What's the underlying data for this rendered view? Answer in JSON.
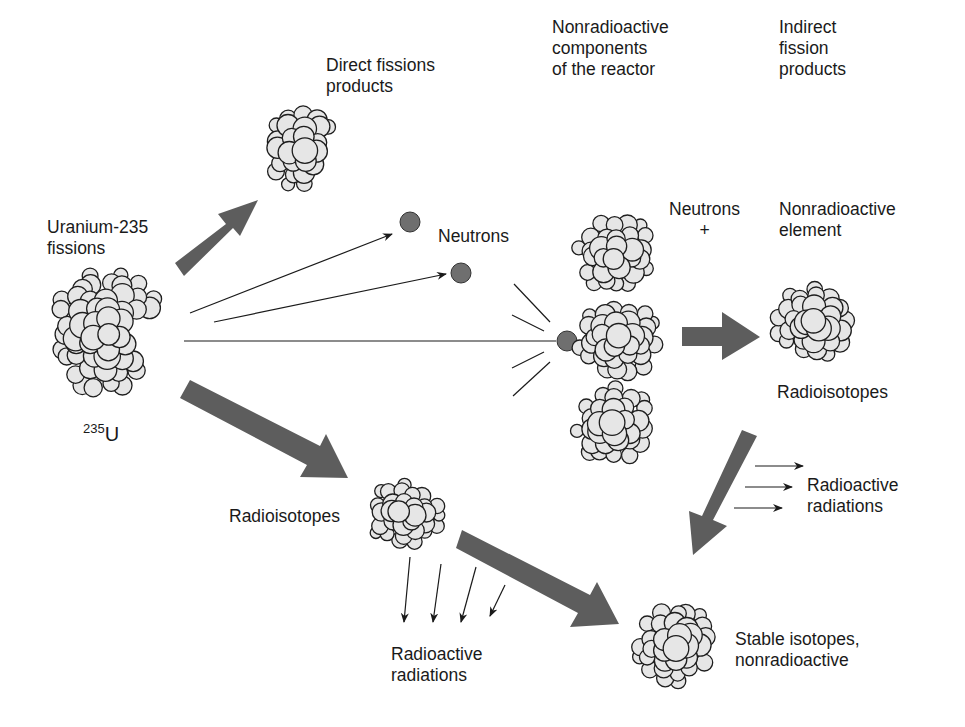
{
  "colors": {
    "background": "#ffffff",
    "arrow_fill": "#5d5d5d",
    "nucleon_fill": "#e6e6e6",
    "nucleon_stroke": "#1e1e1e",
    "neutron_fill": "#6f6f6f",
    "text": "#1a1a1a"
  },
  "labels": {
    "direct_fission_products": "Direct fissions\nproducts",
    "nonradioactive_components": "Nonradioactive\ncomponents\nof the reactor",
    "indirect_fission_products": "Indirect\nfission\nproducts",
    "uranium_fissions": "Uranium-235\nfissions",
    "neutrons": "Neutrons",
    "neutrons_plus": "Neutrons\n+",
    "nonradioactive_element": "Nonradioactive\nelement",
    "radioisotopes_right": "Radioisotopes",
    "radioactive_radiations_right": "Radioactive\nradiations",
    "radioisotopes_left": "Radioisotopes",
    "radioactive_radiations_bottom": "Radioactive\nradiations",
    "stable_isotopes": "Stable isotopes,\nnonradioactive",
    "isotope_mass": "235",
    "isotope_symbol": "U"
  }
}
